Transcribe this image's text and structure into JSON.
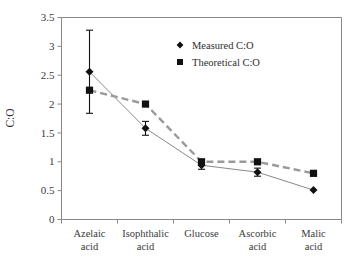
{
  "chart_data": {
    "type": "line",
    "title": "",
    "xlabel": "",
    "ylabel": "C:O",
    "ylim": [
      0,
      3.5
    ],
    "ytick_values": [
      0,
      0.5,
      1,
      1.5,
      2,
      2.5,
      3,
      3.5
    ],
    "ytick_labels": [
      "0",
      "0.5",
      "1",
      "1.5",
      "2",
      "2.5",
      "3",
      "3.5"
    ],
    "grid": false,
    "legend_position": "top-right",
    "categories": [
      "Azelaic acid",
      "Isophthalic acid",
      "Glucose",
      "Ascorbic acid",
      "Malic acid"
    ],
    "category_lines": [
      [
        "Azelaic",
        "acid"
      ],
      [
        "Isophthalic",
        "acid"
      ],
      [
        "Glucose",
        ""
      ],
      [
        "Ascorbic",
        "acid"
      ],
      [
        "Malic",
        "acid"
      ]
    ],
    "series": [
      {
        "name": "Measured C:O",
        "marker": "diamond",
        "linestyle": "solid",
        "color": "#111111",
        "values": [
          2.56,
          1.58,
          0.94,
          0.82,
          0.51
        ],
        "errors": [
          0.72,
          0.12,
          0.07,
          0.07,
          0.0
        ]
      },
      {
        "name": "Theoretical C:O",
        "marker": "square",
        "linestyle": "dashed",
        "color": "#111111",
        "values": [
          2.24,
          2.0,
          1.0,
          1.0,
          0.8
        ],
        "errors": [
          0,
          0,
          0,
          0,
          0
        ]
      }
    ]
  },
  "legend": {
    "entries": [
      {
        "label": "Measured C:O",
        "marker": "diamond"
      },
      {
        "label": "Theoretical C:O",
        "marker": "square"
      }
    ]
  }
}
